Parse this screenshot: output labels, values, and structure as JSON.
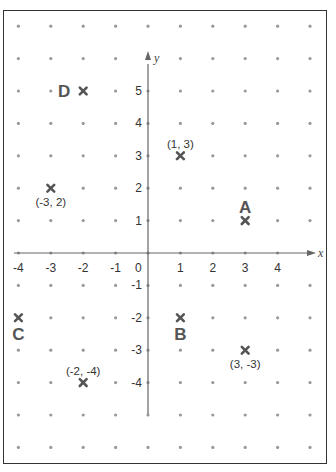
{
  "colors": {
    "frame": "#333333",
    "axis": "#666666",
    "grid_dot": "#999999",
    "marker": "#555555",
    "text": "#333333"
  },
  "chart_data": {
    "type": "scatter",
    "x_axis": {
      "label": "x",
      "range": [
        -4,
        5
      ],
      "ticks": [
        -4,
        -3,
        -2,
        -1,
        1,
        2,
        3,
        4
      ],
      "origin_label": "0"
    },
    "y_axis": {
      "label": "y",
      "range": [
        -6,
        7
      ],
      "ticks": [
        5,
        4,
        3,
        2,
        1,
        -1,
        -2,
        -3,
        -4
      ]
    },
    "grid": {
      "style": "dots",
      "x_range": [
        -4,
        5
      ],
      "y_range": [
        -6,
        7
      ]
    },
    "points": [
      {
        "name": "point-1-3",
        "x": 1,
        "y": 3,
        "label": "(1, 3)",
        "label_pos": "above"
      },
      {
        "name": "point-a",
        "x": 3,
        "y": 1,
        "label": "A",
        "label_pos": "above",
        "letter": true
      },
      {
        "name": "point-d",
        "x": -2,
        "y": 5,
        "label": "D",
        "label_pos": "left",
        "letter": true
      },
      {
        "name": "point-m3-2",
        "x": -3,
        "y": 2,
        "label": "(-3, 2)",
        "label_pos": "below"
      },
      {
        "name": "point-c",
        "x": -4,
        "y": -2,
        "label": "C",
        "label_pos": "below",
        "letter": true
      },
      {
        "name": "point-b",
        "x": 1,
        "y": -2,
        "label": "B",
        "label_pos": "below",
        "letter": true
      },
      {
        "name": "point-3-m3",
        "x": 3,
        "y": -3,
        "label": "(3, -3)",
        "label_pos": "below"
      },
      {
        "name": "point-m2-m4",
        "x": -2,
        "y": -4,
        "label": "(-2, -4)",
        "label_pos": "above"
      }
    ]
  }
}
